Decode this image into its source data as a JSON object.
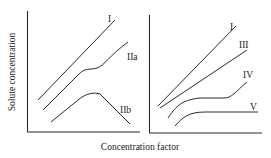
{
  "figure": {
    "xlabel": "Concentration factor",
    "ylabel": "Solute concentration",
    "panels": [
      {
        "name": "left",
        "curves": [
          {
            "id": "I",
            "label": "I"
          },
          {
            "id": "IIa",
            "label": "IIa"
          },
          {
            "id": "IIb",
            "label": "IIb"
          }
        ]
      },
      {
        "name": "right",
        "curves": [
          {
            "id": "I",
            "label": "I"
          },
          {
            "id": "III",
            "label": "III"
          },
          {
            "id": "IV",
            "label": "IV"
          },
          {
            "id": "V",
            "label": "V"
          }
        ]
      }
    ]
  }
}
